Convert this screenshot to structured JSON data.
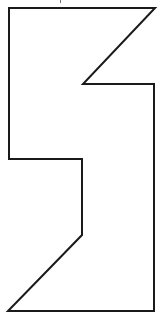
{
  "diagram": {
    "type": "polygon-outline",
    "canvas": {
      "width": 166,
      "height": 321,
      "background": "#ffffff"
    },
    "stroke": {
      "color": "#1a1a1a",
      "width": 2
    },
    "fill": "none",
    "vertices": [
      [
        9,
        8
      ],
      [
        155,
        8
      ],
      [
        83,
        84
      ],
      [
        154,
        84
      ],
      [
        154,
        311
      ],
      [
        8,
        311
      ],
      [
        82,
        235
      ],
      [
        82,
        159
      ],
      [
        9,
        159
      ]
    ],
    "points_attr": "9,8 155,8 83,84 154,84 154,311 8,311 82,235 82,159 9,159"
  }
}
